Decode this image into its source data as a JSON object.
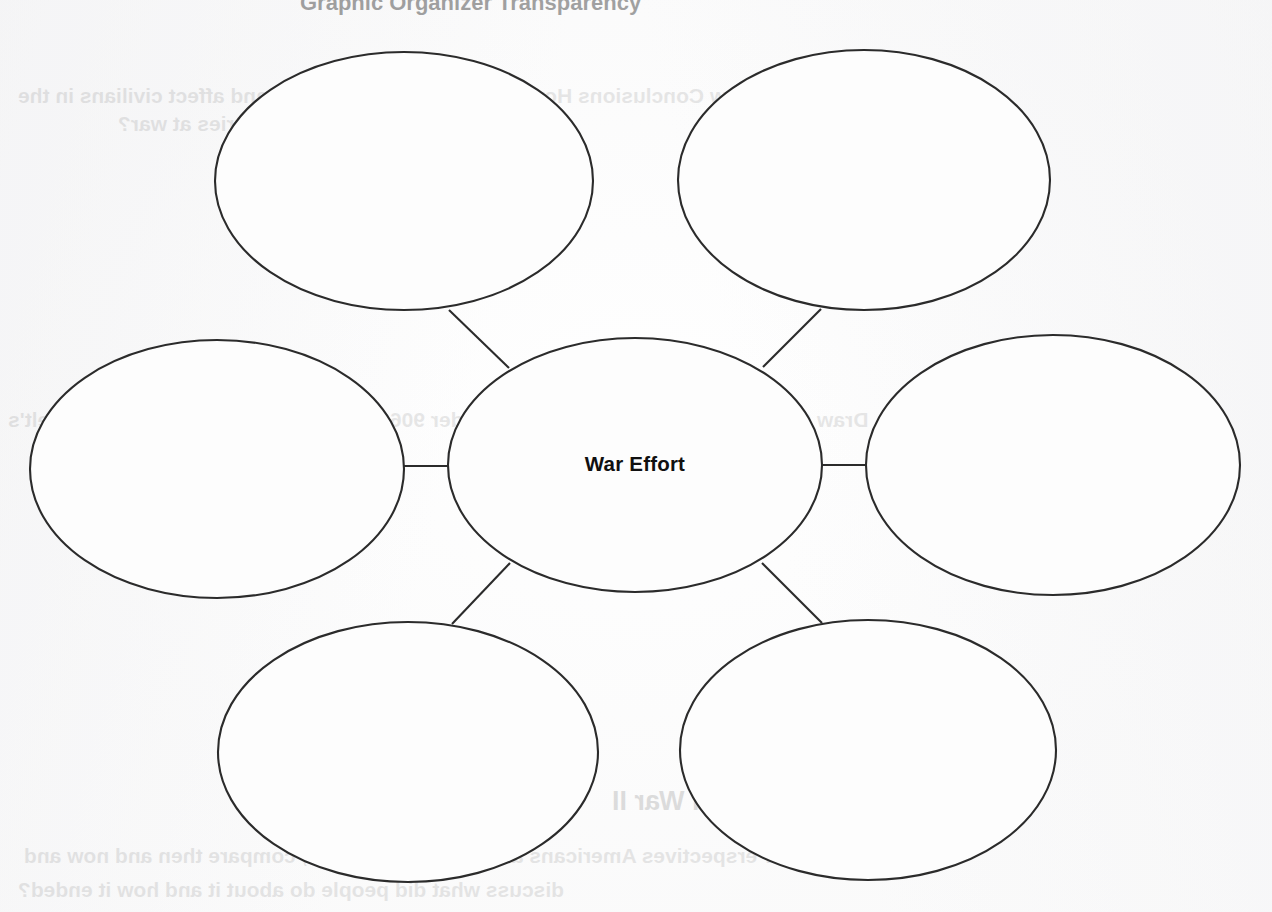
{
  "page": {
    "background_color": "#fbfbfb",
    "ink_color": "#2b2b2b",
    "width": 1272,
    "height": 912
  },
  "diagram": {
    "type": "concept-web",
    "center": {
      "label": "War Effort",
      "cx": 635,
      "cy": 465,
      "rx": 187,
      "ry": 127
    },
    "nodes": [
      {
        "id": "node-top-left",
        "label": "",
        "cx": 404,
        "cy": 181,
        "rx": 189,
        "ry": 129
      },
      {
        "id": "node-top-right",
        "label": "",
        "cx": 864,
        "cy": 180,
        "rx": 186,
        "ry": 130
      },
      {
        "id": "node-middle-left",
        "label": "",
        "cx": 217,
        "cy": 469,
        "rx": 187,
        "ry": 129
      },
      {
        "id": "node-middle-right",
        "label": "",
        "cx": 1053,
        "cy": 465,
        "rx": 187,
        "ry": 130
      },
      {
        "id": "node-bottom-left",
        "label": "",
        "cx": 408,
        "cy": 752,
        "rx": 190,
        "ry": 130
      },
      {
        "id": "node-bottom-right",
        "label": "",
        "cx": 868,
        "cy": 750,
        "rx": 188,
        "ry": 130
      }
    ],
    "connectors": [
      {
        "id": "connector-top-left",
        "x1": 449,
        "y1": 310,
        "x2": 509,
        "y2": 368
      },
      {
        "id": "connector-top-right",
        "x1": 821,
        "y1": 309,
        "x2": 763,
        "y2": 367
      },
      {
        "id": "connector-middle-left",
        "x1": 404,
        "y1": 466,
        "x2": 449,
        "y2": 466
      },
      {
        "id": "connector-middle-right",
        "x1": 822,
        "y1": 465,
        "x2": 867,
        "y2": 465
      },
      {
        "id": "connector-bottom-left",
        "x1": 510,
        "y1": 563,
        "x2": 452,
        "y2": 624
      },
      {
        "id": "connector-bottom-right",
        "x1": 762,
        "y1": 563,
        "x2": 822,
        "y2": 623
      }
    ]
  },
  "bleed_through": {
    "note": "faint mirrored text showing through from the reverse side of the worksheet",
    "top_strip": "Graphic Organizer Transparency",
    "lines": [
      "Draw Conclusions How did the war effort involve and affect civilians in the",
      "United States and the countries at war?",
      "Draw Conclusions How did Executive Order 9066 fail to live up to Franklin Roosevelt's",
      "statement?",
      "Connect to Today: World War II",
      "Identify Perspectives Americans at Vietnam War 1960s; compare then and now and",
      "discuss what did people do about it and how it ended?"
    ]
  }
}
